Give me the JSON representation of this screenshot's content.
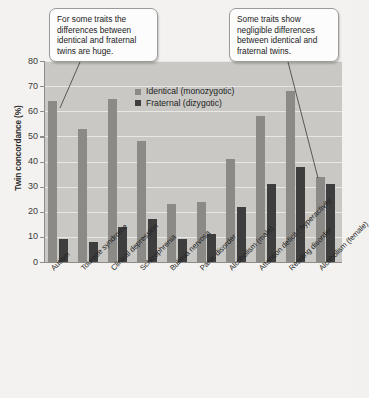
{
  "chart_data": {
    "type": "bar",
    "title": "",
    "xlabel": "",
    "ylabel": "Twin concordance (%)",
    "ylim": [
      0,
      80
    ],
    "ytick_step": 10,
    "yticks": [
      0,
      10,
      20,
      30,
      40,
      50,
      60,
      70,
      80
    ],
    "grid": true,
    "legend_position": "upper-center",
    "categories": [
      "Autism",
      "Tourette syndrome",
      "Clinical depression",
      "Schizophrenia",
      "Bulimia nervosa",
      "Panic disorder",
      "Alcoholism (male)",
      "Attention deficit / hyperactivity",
      "Reading disorder",
      "Alcoholism (female)"
    ],
    "series": [
      {
        "name": "Identical (monozygotic)",
        "color": "#8b8a87",
        "values": [
          64,
          53,
          65,
          48,
          23,
          24,
          41,
          58,
          68,
          34
        ]
      },
      {
        "name": "Fraternal (dizygotic)",
        "color": "#3e3e3e",
        "values": [
          9,
          8,
          14,
          17,
          9,
          11,
          22,
          31,
          38,
          31
        ]
      }
    ],
    "annotations": [
      {
        "id": "callout-left",
        "text": "For some traits the differences between identical and fraternal twins are huge.",
        "points_to": "Autism"
      },
      {
        "id": "callout-right",
        "text": "Some traits show negligible differences between identical and fraternal twins.",
        "points_to": "Alcoholism (female)"
      }
    ]
  },
  "colors": {
    "plot_background": "#c9c8c4",
    "figure_background": "#f3f2f0",
    "gridline": "#e8e7e4",
    "axis": "#8d8c88",
    "identical": "#8b8a87",
    "fraternal": "#3e3e3e",
    "callout_background": "#fcfcfc",
    "callout_border": "#9a9a98"
  }
}
